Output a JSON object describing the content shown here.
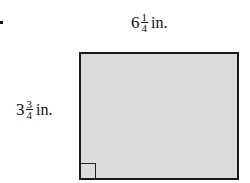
{
  "figure": {
    "width_label": {
      "whole": "6",
      "numerator": "1",
      "denominator": "4",
      "unit": "in."
    },
    "height_label": {
      "whole": "3",
      "numerator": "3",
      "denominator": "4",
      "unit": "in."
    },
    "shape": "rectangle",
    "fill_color": "#dcdcdc",
    "border_color": "#1a1a1a",
    "right_angle_marker": "bottom-left"
  }
}
